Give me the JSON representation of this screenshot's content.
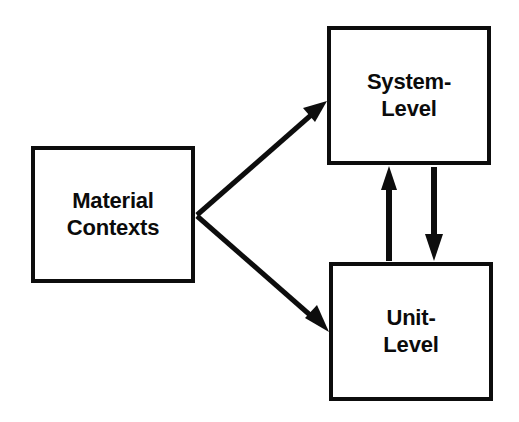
{
  "diagram": {
    "background_color": "#ffffff",
    "stroke_color": "#0d0d0d",
    "text_color": "#0b0b0b",
    "nodes": [
      {
        "id": "material-contexts",
        "label": "Material\nContexts",
        "x": 31,
        "y": 146,
        "width": 164,
        "height": 137
      },
      {
        "id": "system-level",
        "label": "System-\nLevel",
        "x": 327,
        "y": 26,
        "width": 164,
        "height": 139
      },
      {
        "id": "unit-level",
        "label": "Unit-\nLevel",
        "x": 329,
        "y": 262,
        "width": 164,
        "height": 139
      }
    ],
    "edges": [
      {
        "id": "material-to-system",
        "from": "material-contexts",
        "to": "system-level",
        "direction": "one-way",
        "label": ""
      },
      {
        "id": "material-to-unit",
        "from": "material-contexts",
        "to": "unit-level",
        "direction": "one-way",
        "label": ""
      },
      {
        "id": "unit-to-system",
        "from": "unit-level",
        "to": "system-level",
        "direction": "one-way",
        "label": ""
      },
      {
        "id": "system-to-unit",
        "from": "system-level",
        "to": "unit-level",
        "direction": "one-way",
        "label": ""
      }
    ]
  }
}
